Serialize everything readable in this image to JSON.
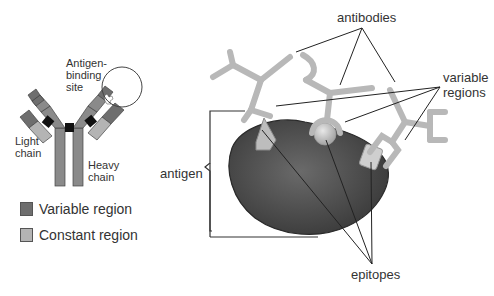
{
  "left_diagram": {
    "labels": {
      "antigen_binding_site": [
        "Antigen-",
        "binding",
        "site"
      ],
      "light_chain": [
        "Light",
        "chain"
      ],
      "heavy_chain": [
        "Heavy",
        "chain"
      ]
    }
  },
  "legend": {
    "items": [
      {
        "label": "Variable region",
        "color": "#6e6e6e"
      },
      {
        "label": "Constant region",
        "color": "#b4b4b4"
      }
    ]
  },
  "right_diagram": {
    "labels": {
      "antibodies": "antibodies",
      "variable_regions": [
        "variable",
        "regions"
      ],
      "antigen": "antigen",
      "epitopes": "epitopes"
    }
  },
  "colors": {
    "variable": "#6e6e6e",
    "constant": "#b4b4b4",
    "heavy": "#8a8a8a",
    "hinge": "#111111",
    "antigen_body": "#4a4a4a",
    "antibody_light": "#b8b8b8"
  }
}
